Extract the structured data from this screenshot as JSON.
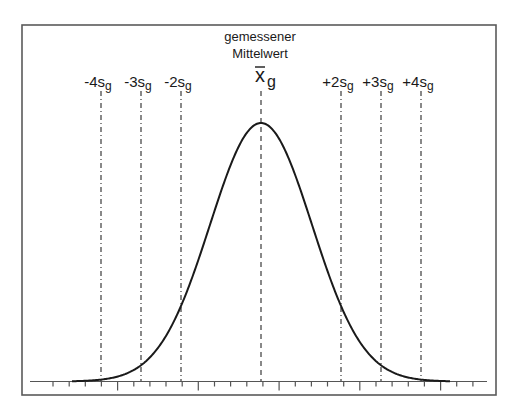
{
  "title": {
    "line1": "gemessener",
    "line2": "Mittelwert"
  },
  "mean_label": {
    "symbol": "x",
    "subscript": "g"
  },
  "sigma_lines": [
    {
      "id": "minus-4s",
      "prefix": "-4",
      "symbol": "s",
      "subscript": "g",
      "k": -4
    },
    {
      "id": "minus-3s",
      "prefix": "-3",
      "symbol": "s",
      "subscript": "g",
      "k": -3
    },
    {
      "id": "minus-2s",
      "prefix": "-2",
      "symbol": "s",
      "subscript": "g",
      "k": -2
    },
    {
      "id": "plus-2s",
      "prefix": "+2",
      "symbol": "s",
      "subscript": "g",
      "k": 2
    },
    {
      "id": "plus-3s",
      "prefix": "+3",
      "symbol": "s",
      "subscript": "g",
      "k": 3
    },
    {
      "id": "plus-4s",
      "prefix": "+4",
      "symbol": "s",
      "subscript": "g",
      "k": 4
    }
  ],
  "geometry": {
    "frame": {
      "x1": 22,
      "y1": 25,
      "x2": 496,
      "y2": 395
    },
    "axis": {
      "y": 381.5,
      "x_start": 30,
      "x_end": 487
    },
    "center_x": 261,
    "s_px": 40,
    "curve_sigma_px": 51,
    "peak_y": 123,
    "curve_x_range": [
      72,
      450
    ],
    "line_top_y": 91,
    "ticks": {
      "start": 53,
      "step": 16.15,
      "count": 27,
      "long_every": 5,
      "long_offset": 4
    }
  },
  "colors": {
    "frame": "#5a5a5a",
    "curve": "#1a1a1a",
    "dashed": "#3a3a3a",
    "axis": "#555555",
    "text": "#1a1a1a"
  }
}
